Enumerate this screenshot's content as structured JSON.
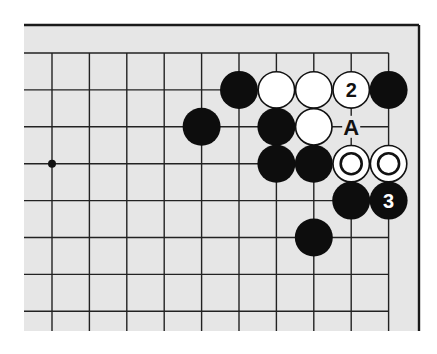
{
  "diagram": {
    "type": "go-board-corner",
    "board": {
      "background": "#e6e6e6",
      "line_color": "#222222",
      "frame_color": "#1a1a1a",
      "frame": {
        "left": 24,
        "top": 25,
        "right": 419,
        "bottom": 331
      },
      "grid_origin": {
        "x": 52,
        "y": 53
      },
      "col_spacing": 37.4,
      "row_spacing": 36.9,
      "columns": 10,
      "rows": 8,
      "edges": [
        "top",
        "right"
      ]
    },
    "star_points": [
      {
        "col": 0,
        "row": 3
      }
    ],
    "stones": [
      {
        "color": "black",
        "col": 5,
        "row": 1,
        "label": ""
      },
      {
        "color": "white",
        "col": 6,
        "row": 1,
        "label": ""
      },
      {
        "color": "white",
        "col": 7,
        "row": 1,
        "label": ""
      },
      {
        "color": "white",
        "col": 8,
        "row": 1,
        "label": "2"
      },
      {
        "color": "black",
        "col": 9,
        "row": 1,
        "label": ""
      },
      {
        "color": "black",
        "col": 4,
        "row": 2,
        "label": ""
      },
      {
        "color": "black",
        "col": 6,
        "row": 2,
        "label": ""
      },
      {
        "color": "white",
        "col": 7,
        "row": 2,
        "label": ""
      },
      {
        "color": "black",
        "col": 6,
        "row": 3,
        "label": ""
      },
      {
        "color": "black",
        "col": 7,
        "row": 3,
        "label": ""
      },
      {
        "color": "white",
        "col": 8,
        "row": 3,
        "label": "",
        "marker": "circle"
      },
      {
        "color": "white",
        "col": 9,
        "row": 3,
        "label": "",
        "marker": "circle"
      },
      {
        "color": "black",
        "col": 8,
        "row": 4,
        "label": ""
      },
      {
        "color": "black",
        "col": 9,
        "row": 4,
        "label": "3"
      },
      {
        "color": "black",
        "col": 7,
        "row": 5,
        "label": ""
      }
    ],
    "point_labels": [
      {
        "text": "A",
        "col": 8,
        "row": 2
      }
    ],
    "stone_radius": 19
  }
}
